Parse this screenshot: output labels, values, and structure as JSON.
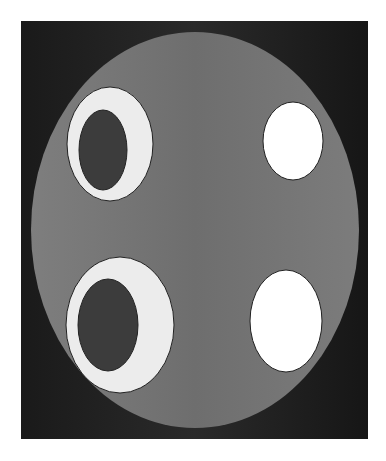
{
  "figure": {
    "title": "",
    "background": {
      "x": 21,
      "y": 21,
      "width": 347,
      "height": 418,
      "color": "#1e1e1e"
    },
    "phantom": {
      "cx": 195,
      "cy": 230,
      "rx": 164,
      "ry": 198,
      "color": "#7a7a7a"
    },
    "inserts": [
      {
        "name": "top-left-ring",
        "outer": {
          "cx": 110,
          "cy": 144,
          "rx": 43,
          "ry": 57,
          "color": "#ececec"
        },
        "inner": {
          "cx": 103,
          "cy": 150,
          "rx": 24,
          "ry": 40,
          "color": "#3c3c3c"
        }
      },
      {
        "name": "top-right-disk",
        "outer": {
          "cx": 293,
          "cy": 141,
          "rx": 30,
          "ry": 39,
          "color": "#ffffff"
        }
      },
      {
        "name": "bottom-left-ring",
        "outer": {
          "cx": 120,
          "cy": 325,
          "rx": 54,
          "ry": 68,
          "color": "#ececec"
        },
        "inner": {
          "cx": 108,
          "cy": 325,
          "rx": 30,
          "ry": 46,
          "color": "#3c3c3c"
        }
      },
      {
        "name": "bottom-right-disk",
        "outer": {
          "cx": 286,
          "cy": 321,
          "rx": 36,
          "ry": 51,
          "color": "#ffffff"
        }
      }
    ]
  }
}
